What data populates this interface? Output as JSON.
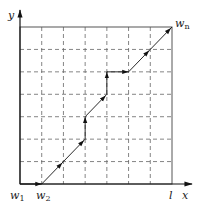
{
  "diagram": {
    "type": "warping-path-grid",
    "grid": {
      "columns": 7,
      "rows": 7,
      "frame_color": "#555555",
      "grid_line_style": "dashed",
      "grid_color": "#666666"
    },
    "axes": {
      "x_label": "x",
      "y_label": "y",
      "x_end_tick_label": "l"
    },
    "points": {
      "w1": {
        "label": "w",
        "subscript": "1",
        "grid": [
          0,
          0
        ]
      },
      "w2": {
        "label": "w",
        "subscript": "2",
        "grid": [
          1,
          0
        ]
      },
      "wn": {
        "label": "w",
        "subscript": "n",
        "grid": [
          7,
          7
        ]
      }
    },
    "path": [
      [
        0,
        0
      ],
      [
        1,
        0
      ],
      [
        2,
        1
      ],
      [
        3,
        2
      ],
      [
        3,
        3
      ],
      [
        4,
        4
      ],
      [
        4,
        5
      ],
      [
        5,
        5
      ],
      [
        6,
        6
      ],
      [
        7,
        7
      ]
    ],
    "path_color": "#111111"
  }
}
